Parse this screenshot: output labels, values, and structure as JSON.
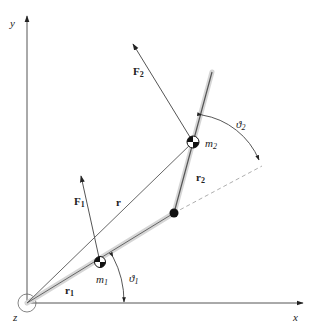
{
  "diagram": {
    "axes": {
      "x_label": "x",
      "y_label": "y",
      "z_label": "z"
    },
    "labels": {
      "F1": "F",
      "F1_sub": "1",
      "F2": "F",
      "F2_sub": "2",
      "r": "r",
      "r1": "r",
      "r1_sub": "1",
      "r2": "r",
      "r2_sub": "2",
      "m1": "m",
      "m1_sub": "1",
      "m2": "m",
      "m2_sub": "2",
      "theta1": "ϑ",
      "theta1_sub": "1",
      "theta2": "ϑ",
      "theta2_sub": "2"
    },
    "colors": {
      "line": "#444444",
      "rod_shadow": "#cfcfcf",
      "mass": "#111111"
    }
  }
}
